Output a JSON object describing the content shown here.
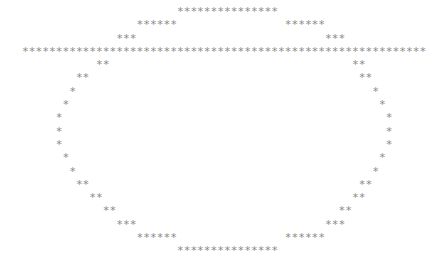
{
  "art": {
    "glyph": "*",
    "color": "#8a8a8a",
    "columns": 60,
    "lines": [
      "                       ***************",
      "                 ******                ******",
      "              ***                            ***",
      "************************************************************",
      "           **                                    **",
      "        **                                        **",
      "       *                                            *",
      "      *                                              *",
      "     *                                                *",
      "     *                                                *",
      "     *                                                *",
      "      *                                              *",
      "       *                                            *",
      "        **                                        **",
      "          **                                     **",
      "            **                                 **",
      "              ***                            ***",
      "                 ******                ******",
      "                       ***************"
    ]
  }
}
